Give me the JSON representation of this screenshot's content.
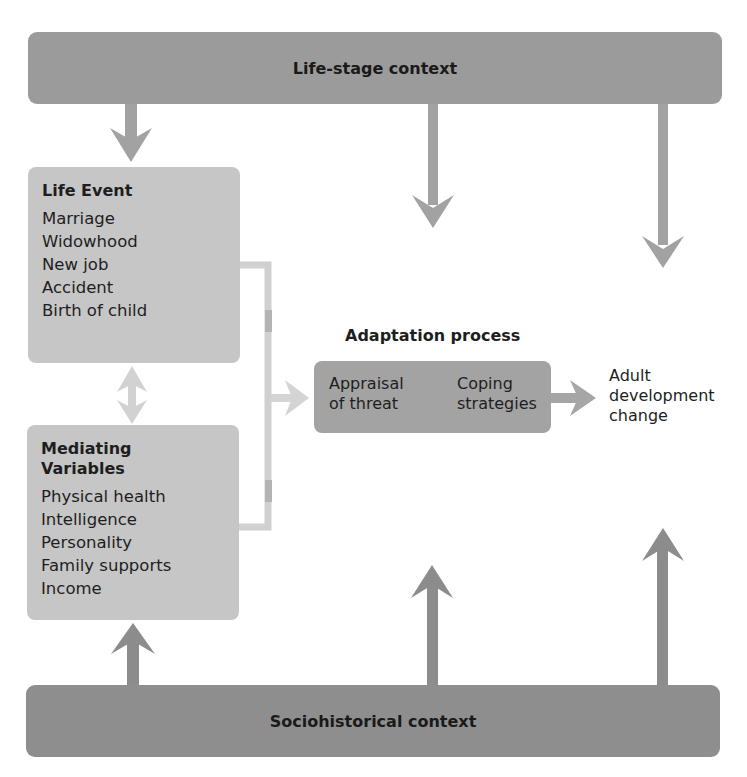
{
  "diagram": {
    "top_context": "Life-stage context",
    "bottom_context": "Sociohistorical context",
    "life_event": {
      "title": "Life Event",
      "items": [
        "Marriage",
        "Widowhood",
        "New job",
        "Accident",
        "Birth of child"
      ]
    },
    "mediating_variables": {
      "title_line1": "Mediating",
      "title_line2": "Variables",
      "items": [
        "Physical health",
        "Intelligence",
        "Personality",
        "Family supports",
        "Income"
      ]
    },
    "adaptation": {
      "title": "Adaptation process",
      "appraisal_line1": "Appraisal",
      "appraisal_line2": "of threat",
      "coping_line1": "Coping",
      "coping_line2": "strategies"
    },
    "outcome": {
      "line1": "Adult",
      "line2": "development",
      "line3": "change"
    },
    "colors": {
      "context_bar": "#9b9b9b",
      "box_light": "#c6c6c6",
      "adapt_box": "#a3a3a3",
      "arrow_dark": "#8c8c8c",
      "arrow_light": "#d4d4d4"
    }
  }
}
